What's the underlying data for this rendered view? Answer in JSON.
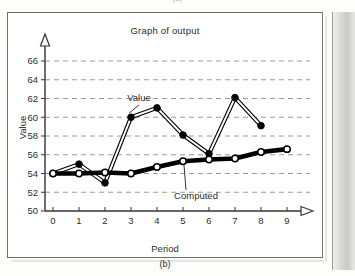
{
  "figure": {
    "caption_bottom": "(b)",
    "caption_top_partial": "(a)"
  },
  "chart_data": {
    "type": "line",
    "title": "Graph of output",
    "xlabel": "Period",
    "ylabel": "Value",
    "xlim": [
      0,
      9
    ],
    "ylim": [
      50,
      66
    ],
    "grid": true,
    "grid_axis": "y",
    "grid_style": "dashed",
    "legend": "inline-annotations",
    "x": [
      0,
      1,
      2,
      3,
      4,
      5,
      6,
      7,
      8,
      9
    ],
    "xticks": [
      "0",
      "1",
      "2",
      "3",
      "4",
      "5",
      "6",
      "7",
      "8",
      "9"
    ],
    "yticks": [
      "50",
      "52",
      "54",
      "56",
      "58",
      "60",
      "62",
      "64",
      "66"
    ],
    "series": [
      {
        "name": "Value",
        "marker": "filled-circle",
        "line": "thin-double",
        "color": "#000000",
        "x": [
          0,
          1,
          2,
          3,
          4,
          5,
          6,
          7,
          8
        ],
        "values": [
          54.0,
          55.0,
          53.0,
          60.0,
          61.0,
          58.1,
          56.1,
          62.1,
          59.1
        ]
      },
      {
        "name": "Computed",
        "marker": "open-circle",
        "line": "thick-solid",
        "color": "#000000",
        "x": [
          0,
          1,
          2,
          3,
          4,
          5,
          6,
          7,
          8,
          9
        ],
        "values": [
          54.0,
          54.0,
          54.1,
          54.0,
          54.7,
          55.3,
          55.5,
          55.6,
          56.3,
          56.6
        ]
      }
    ],
    "annotations": [
      {
        "text": "Value",
        "target_series": "Value",
        "target_point_index": 3
      },
      {
        "text": "Computed",
        "target_series": "Computed",
        "target_point_index": 5
      }
    ]
  }
}
